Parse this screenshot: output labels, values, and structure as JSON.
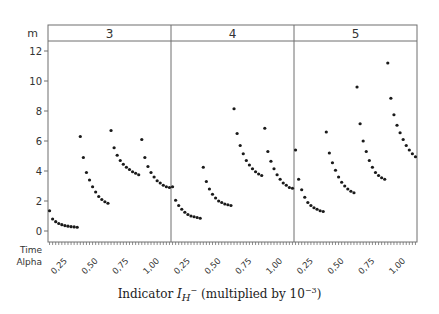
{
  "chart_data": {
    "type": "scatter",
    "title": "",
    "ylabel": "m",
    "xlabel": "Indicator I_H^- (multiplied by 10^-3)",
    "xlabel_parts": {
      "prefix": "Indicator ",
      "symbol": "I",
      "sub": "H",
      "sup": "−",
      "suffix": " (multiplied by 10",
      "exp": "−3",
      "close": ")"
    },
    "ylim": [
      0,
      12.7
    ],
    "yticks": [
      0,
      2,
      4,
      6,
      8,
      10,
      12
    ],
    "grid": false,
    "legend": null,
    "panel_variable_label": "m",
    "x_row_labels": [
      "Time",
      "Alpha"
    ],
    "alpha_tick_labels": [
      "0,25",
      "0,50",
      "0,75",
      "1,00"
    ],
    "points_per_group": 10,
    "panels": [
      {
        "label": "3",
        "groups": [
          {
            "alpha": "0,25",
            "values": [
              1.35,
              0.8,
              0.62,
              0.5,
              0.42,
              0.36,
              0.32,
              0.29,
              0.27,
              0.25
            ]
          },
          {
            "alpha": "0,50",
            "values": [
              6.3,
              4.9,
              3.9,
              3.4,
              2.95,
              2.6,
              2.3,
              2.1,
              1.95,
              1.85
            ]
          },
          {
            "alpha": "0,75",
            "values": [
              6.7,
              5.55,
              5.05,
              4.7,
              4.45,
              4.25,
              4.1,
              3.95,
              3.85,
              3.75
            ]
          },
          {
            "alpha": "1,00",
            "values": [
              6.1,
              4.9,
              4.3,
              3.9,
              3.6,
              3.35,
              3.2,
              3.05,
              2.95,
              2.9
            ]
          }
        ]
      },
      {
        "label": "4",
        "groups": [
          {
            "alpha": "0,25",
            "values": [
              2.95,
              2.05,
              1.7,
              1.45,
              1.25,
              1.1,
              1.0,
              0.95,
              0.9,
              0.85
            ]
          },
          {
            "alpha": "0,50",
            "values": [
              4.25,
              3.3,
              2.8,
              2.45,
              2.2,
              2.0,
              1.9,
              1.8,
              1.75,
              1.7
            ]
          },
          {
            "alpha": "0,75",
            "values": [
              8.15,
              6.5,
              5.7,
              5.15,
              4.7,
              4.4,
              4.15,
              3.95,
              3.8,
              3.7
            ]
          },
          {
            "alpha": "1,00",
            "values": [
              6.85,
              5.3,
              4.65,
              4.15,
              3.75,
              3.45,
              3.2,
              3.05,
              2.9,
              2.85
            ]
          }
        ]
      },
      {
        "label": "5",
        "groups": [
          {
            "alpha": "0,25",
            "values": [
              5.4,
              3.45,
              2.75,
              2.25,
              1.9,
              1.7,
              1.55,
              1.45,
              1.35,
              1.3
            ]
          },
          {
            "alpha": "0,50",
            "values": [
              6.6,
              5.2,
              4.55,
              4.05,
              3.6,
              3.25,
              3.0,
              2.8,
              2.65,
              2.55
            ]
          },
          {
            "alpha": "0,75",
            "values": [
              9.6,
              7.15,
              6.0,
              5.3,
              4.7,
              4.25,
              3.9,
              3.7,
              3.55,
              3.45
            ]
          },
          {
            "alpha": "1,00",
            "values": [
              11.2,
              8.85,
              7.75,
              7.05,
              6.55,
              6.1,
              5.7,
              5.4,
              5.15,
              4.95
            ]
          }
        ]
      }
    ],
    "colors": {
      "points": "#1a1a1a",
      "frame": "#6e6e6e",
      "text": "#333333"
    }
  }
}
